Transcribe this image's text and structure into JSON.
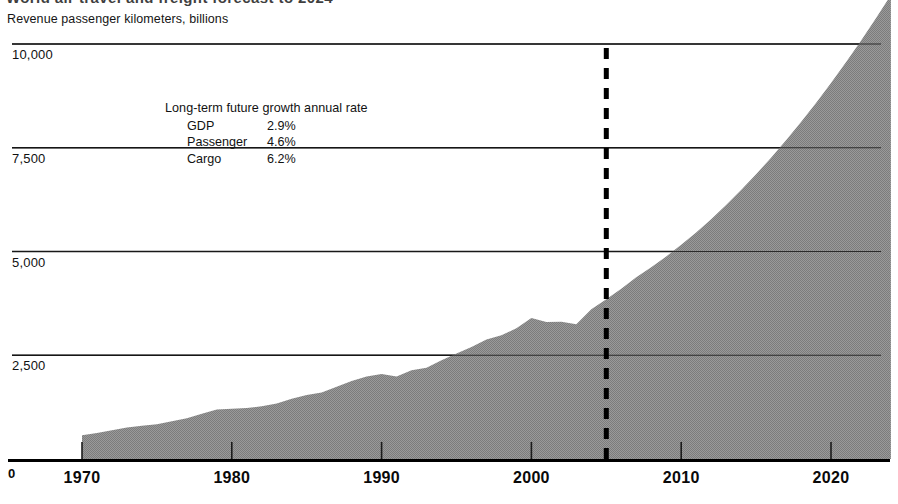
{
  "headline": {
    "text": "World air travel and freight forecast to 2024"
  },
  "chart_data": {
    "type": "area",
    "title": "Revenue passenger kilometers, billions",
    "xlabel": "",
    "ylabel": "Revenue passenger kilometers, billions",
    "ylim": [
      0,
      10000
    ],
    "xlim": [
      1968,
      2024
    ],
    "grid": true,
    "legend_position": "none",
    "y_ticks": [
      "0",
      "2,500",
      "5,000",
      "7,500",
      "10,000"
    ],
    "y_tick_values": [
      0,
      2500,
      5000,
      7500,
      10000
    ],
    "x_ticks": [
      "1970",
      "1980",
      "1990",
      "2000",
      "2010",
      "2020"
    ],
    "x_tick_values": [
      1970,
      1980,
      1990,
      2000,
      2010,
      2020
    ],
    "series_name": "Revenue passenger kilometers",
    "fill_color": "#8e8e8e",
    "forecast_divider_year": 2005,
    "x": [
      1970,
      1971,
      1972,
      1973,
      1974,
      1975,
      1976,
      1977,
      1978,
      1979,
      1980,
      1981,
      1982,
      1983,
      1984,
      1985,
      1986,
      1987,
      1988,
      1989,
      1990,
      1991,
      1992,
      1993,
      1994,
      1995,
      1996,
      1997,
      1998,
      1999,
      2000,
      2001,
      2002,
      2003,
      2004,
      2005,
      2006,
      2007,
      2008,
      2009,
      2010,
      2011,
      2012,
      2013,
      2014,
      2015,
      2016,
      2017,
      2018,
      2019,
      2020,
      2021,
      2022,
      2023,
      2024
    ],
    "values": [
      575,
      625,
      690,
      760,
      800,
      840,
      910,
      980,
      1090,
      1190,
      1210,
      1230,
      1270,
      1340,
      1450,
      1540,
      1600,
      1740,
      1880,
      1990,
      2050,
      1990,
      2140,
      2200,
      2380,
      2540,
      2700,
      2880,
      2980,
      3150,
      3400,
      3300,
      3310,
      3250,
      3610,
      3850,
      4100,
      4380,
      4620,
      4880,
      5160,
      5460,
      5780,
      6120,
      6480,
      6860,
      7260,
      7680,
      8120,
      8580,
      9060,
      9560,
      10080,
      10620,
      11180
    ]
  },
  "annotation": {
    "title": "Long-term future growth annual rate",
    "rows": [
      {
        "label": "GDP",
        "value": "2.9%"
      },
      {
        "label": "Passenger",
        "value": "4.6%"
      },
      {
        "label": "Cargo",
        "value": "6.2%"
      }
    ]
  },
  "axis": {
    "zero_label": "0"
  }
}
